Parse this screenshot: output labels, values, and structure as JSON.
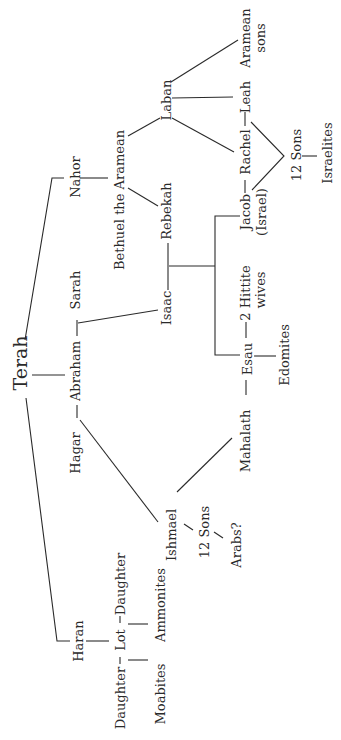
{
  "diagram": {
    "orientation": "rotated 90deg counter-clockwise",
    "nodes": {
      "terah": "Terah",
      "nahor": "Nahor",
      "abraham": "Abraham",
      "sarah": "Sarah",
      "hagar": "Hagar",
      "haran": "Haran",
      "bethuel": "Bethuel the Aramean",
      "rebekah": "Rebekah",
      "isaac": "Isaac",
      "laban": "Laban",
      "ishmael": "Ishmael",
      "daughter_1": "Daughter",
      "lot": "Lot",
      "daughter_2": "Daughter",
      "moabites": "Moabites",
      "ammonites": "Ammonites",
      "ishmael_sons": "12 Sons",
      "arabs": "Arabs?",
      "jacob": "Jacob",
      "israel": "(Israel)",
      "rachel": "Rachel",
      "leah": "Leah",
      "aramean": "Aramean",
      "aramean_sons": "sons",
      "jacob_sons": "12 Sons",
      "israelites": "Israelites",
      "hittite_1": "2 Hittite",
      "hittite_2": "wives",
      "esau": "Esau",
      "edomites": "Edomites",
      "mahalath": "Mahalath"
    }
  }
}
